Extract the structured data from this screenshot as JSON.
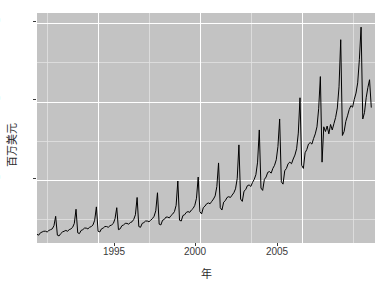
{
  "chart_data": {
    "type": "line",
    "title": "",
    "subtitle": "",
    "xlabel": "年",
    "ylabel": "百万美元",
    "xlim": [
      1992.0,
      2008.6
    ],
    "ylim": [
      2.0,
      31.3
    ],
    "x_ticks": [
      1995,
      2000,
      2005
    ],
    "x_tick_labels": [
      "1995",
      "2000",
      "2005"
    ],
    "y_ticks": [
      10,
      20,
      30
    ],
    "y_tick_labels": [
      "10",
      "20",
      "30"
    ],
    "x_minor_ticks": [
      1992.5,
      1997.5,
      2002.5,
      2007.5
    ],
    "y_minor_ticks": [
      5,
      15,
      25
    ],
    "grid": true,
    "grid_major_color": "#ffffff",
    "grid_minor_color": "#e2e2e2",
    "panel_background": "#c3c3c3",
    "line_color": "#000000",
    "line_width": 1.0,
    "legend_position": "none",
    "series": [
      {
        "name": "月度零售额",
        "x": [
          1992.0,
          1992.083,
          1992.167,
          1992.25,
          1992.333,
          1992.417,
          1992.5,
          1992.583,
          1992.667,
          1992.75,
          1992.833,
          1992.917,
          1993.0,
          1993.083,
          1993.167,
          1993.25,
          1993.333,
          1993.417,
          1993.5,
          1993.583,
          1993.667,
          1993.75,
          1993.833,
          1993.917,
          1994.0,
          1994.083,
          1994.167,
          1994.25,
          1994.333,
          1994.417,
          1994.5,
          1994.583,
          1994.667,
          1994.75,
          1994.833,
          1994.917,
          1995.0,
          1995.083,
          1995.167,
          1995.25,
          1995.333,
          1995.417,
          1995.5,
          1995.583,
          1995.667,
          1995.75,
          1995.833,
          1995.917,
          1996.0,
          1996.083,
          1996.167,
          1996.25,
          1996.333,
          1996.417,
          1996.5,
          1996.583,
          1996.667,
          1996.75,
          1996.833,
          1996.917,
          1997.0,
          1997.083,
          1997.167,
          1997.25,
          1997.333,
          1997.417,
          1997.5,
          1997.583,
          1997.667,
          1997.75,
          1997.833,
          1997.917,
          1998.0,
          1998.083,
          1998.167,
          1998.25,
          1998.333,
          1998.417,
          1998.5,
          1998.583,
          1998.667,
          1998.75,
          1998.833,
          1998.917,
          1999.0,
          1999.083,
          1999.167,
          1999.25,
          1999.333,
          1999.417,
          1999.5,
          1999.583,
          1999.667,
          1999.75,
          1999.833,
          1999.917,
          2000.0,
          2000.083,
          2000.167,
          2000.25,
          2000.333,
          2000.417,
          2000.5,
          2000.583,
          2000.667,
          2000.75,
          2000.833,
          2000.917,
          2001.0,
          2001.083,
          2001.167,
          2001.25,
          2001.333,
          2001.417,
          2001.5,
          2001.583,
          2001.667,
          2001.75,
          2001.833,
          2001.917,
          2002.0,
          2002.083,
          2002.167,
          2002.25,
          2002.333,
          2002.417,
          2002.5,
          2002.583,
          2002.667,
          2002.75,
          2002.833,
          2002.917,
          2003.0,
          2003.083,
          2003.167,
          2003.25,
          2003.333,
          2003.417,
          2003.5,
          2003.583,
          2003.667,
          2003.75,
          2003.833,
          2003.917,
          2004.0,
          2004.083,
          2004.167,
          2004.25,
          2004.333,
          2004.417,
          2004.5,
          2004.583,
          2004.667,
          2004.75,
          2004.833,
          2004.917,
          2005.0,
          2005.083,
          2005.167,
          2005.25,
          2005.333,
          2005.417,
          2005.5,
          2005.583,
          2005.667,
          2005.75,
          2005.833,
          2005.917,
          2006.0,
          2006.083,
          2006.167,
          2006.25,
          2006.333,
          2006.417,
          2006.5,
          2006.583,
          2006.667,
          2006.75,
          2006.833,
          2006.917,
          2007.0,
          2007.083,
          2007.167,
          2007.25,
          2007.333,
          2007.417,
          2007.5,
          2007.583,
          2007.667,
          2007.75,
          2007.833,
          2007.917,
          2008.0,
          2008.083,
          2008.167,
          2008.25,
          2008.333,
          2008.417
        ],
        "values": [
          3.1,
          3.0,
          3.3,
          3.4,
          3.5,
          3.5,
          3.4,
          3.6,
          3.7,
          3.8,
          4.2,
          5.4,
          3.0,
          2.9,
          3.2,
          3.4,
          3.5,
          3.6,
          3.5,
          3.7,
          3.8,
          4.0,
          4.5,
          6.3,
          3.3,
          3.2,
          3.6,
          3.7,
          3.9,
          3.9,
          3.8,
          4.0,
          4.1,
          4.3,
          4.9,
          6.6,
          3.5,
          3.4,
          3.8,
          3.9,
          4.1,
          4.1,
          4.0,
          4.2,
          4.3,
          4.5,
          5.1,
          6.5,
          3.7,
          3.8,
          4.2,
          4.3,
          4.5,
          4.5,
          4.4,
          4.6,
          4.7,
          5.0,
          5.6,
          7.8,
          4.1,
          4.0,
          4.5,
          4.6,
          4.8,
          4.8,
          4.7,
          4.9,
          5.1,
          5.4,
          6.1,
          8.4,
          4.4,
          4.3,
          4.9,
          5.0,
          5.3,
          5.3,
          5.2,
          5.5,
          5.7,
          6.0,
          6.8,
          9.9,
          4.9,
          4.8,
          5.5,
          5.6,
          5.9,
          6.0,
          5.9,
          6.2,
          6.4,
          6.8,
          7.7,
          10.4,
          6.0,
          5.7,
          6.5,
          6.7,
          7.0,
          7.1,
          7.0,
          7.3,
          7.6,
          8.0,
          9.2,
          12.2,
          6.5,
          6.2,
          7.2,
          7.4,
          7.8,
          7.9,
          7.8,
          8.1,
          8.4,
          8.9,
          10.2,
          14.5,
          7.6,
          7.3,
          8.6,
          8.8,
          9.3,
          9.4,
          9.2,
          9.7,
          10.1,
          10.7,
          12.3,
          16.4,
          9.0,
          8.7,
          10.1,
          10.4,
          11.0,
          11.1,
          10.9,
          11.5,
          11.9,
          12.6,
          14.3,
          17.8,
          9.8,
          9.5,
          11.2,
          11.5,
          12.1,
          12.3,
          12.1,
          12.7,
          13.2,
          14.0,
          16.0,
          20.5,
          11.9,
          11.5,
          13.5,
          13.9,
          14.6,
          14.8,
          14.6,
          15.3,
          15.9,
          16.8,
          19.1,
          23.2,
          12.3,
          16.8,
          16.2,
          16.9,
          15.9,
          17.1,
          16.4,
          17.2,
          18.0,
          19.2,
          21.9,
          27.9,
          15.7,
          16.2,
          17.5,
          18.2,
          19.0,
          19.5,
          19.3,
          20.3,
          21.1,
          22.4,
          25.4,
          29.5,
          17.8,
          18.6,
          20.5,
          21.8,
          22.8,
          19.3
        ]
      }
    ],
    "annotations": []
  },
  "axes": {
    "y_label": "百万美元",
    "x_label": "年",
    "y_tick_labels": [
      "30",
      "20",
      "10"
    ],
    "x_tick_labels": [
      "1995",
      "2000",
      "2005"
    ]
  }
}
